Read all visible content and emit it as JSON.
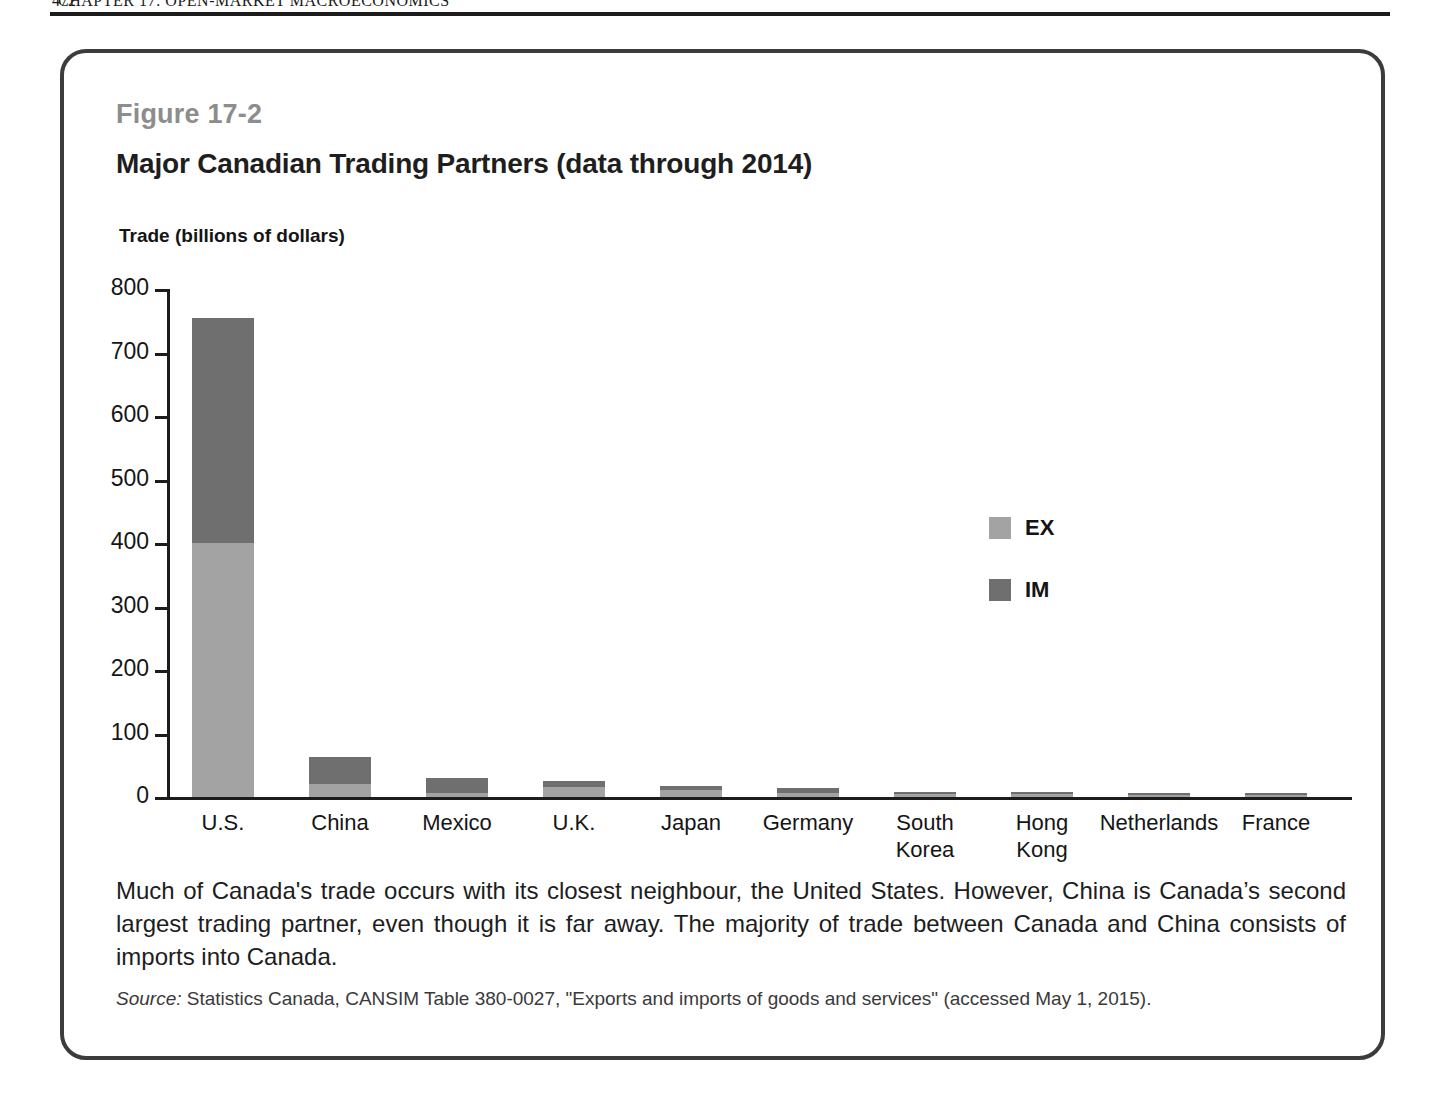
{
  "running_header": {
    "folio": "472",
    "text": "CHAPTER 17: OPEN-MARKET MACROECONOMICS"
  },
  "figure": {
    "number": "Figure 17-2",
    "title": "Major Canadian Trading Partners (data through 2014)",
    "caption": "Much of Canada's trade occurs with its closest neighbour, the United States. However, China is Canada’s second largest trading partner, even though it is far away. The majority of trade between Canada and China consists of imports into Canada.",
    "source_label": "Source:",
    "source_text": "Statistics Canada, CANSIM Table 380-0027, \"Exports and imports of goods and services\"  (accessed May 1, 2015)."
  },
  "colors": {
    "export": "#a3a3a3",
    "import": "#6f6f6f",
    "axis": "#1c1c1c",
    "figure_number": "#8d8d8d",
    "box_border": "#3c3c3c"
  },
  "chart_data": {
    "type": "bar",
    "subtype": "stacked",
    "title": "Major Canadian Trading Partners (data through 2014)",
    "xlabel": "",
    "ylabel": "Trade (billions of dollars)",
    "ylim": [
      0,
      800
    ],
    "yticks": [
      0,
      100,
      200,
      300,
      400,
      500,
      600,
      700,
      800
    ],
    "ytick_labels": [
      "0",
      "100",
      "200",
      "300",
      "400",
      "500",
      "600",
      "700",
      "800"
    ],
    "grid": false,
    "legend_position": "inside-right",
    "categories": [
      "U.S.",
      "China",
      "Mexico",
      "U.K.",
      "Japan",
      "Germany",
      "South Korea",
      "Hong Kong",
      "Netherlands",
      "France"
    ],
    "series": [
      {
        "name": "EX",
        "label": "EX",
        "color": "#a3a3a3",
        "values": [
          400,
          20,
          7,
          15,
          11,
          6,
          4,
          4,
          3,
          3
        ]
      },
      {
        "name": "IM",
        "label": "IM",
        "color": "#6f6f6f",
        "values": [
          355,
          43,
          23,
          10,
          6,
          9,
          4,
          3,
          3,
          3
        ]
      }
    ],
    "totals": [
      755,
      63,
      30,
      25,
      17,
      15,
      8,
      7,
      6,
      6
    ],
    "annotations": []
  }
}
